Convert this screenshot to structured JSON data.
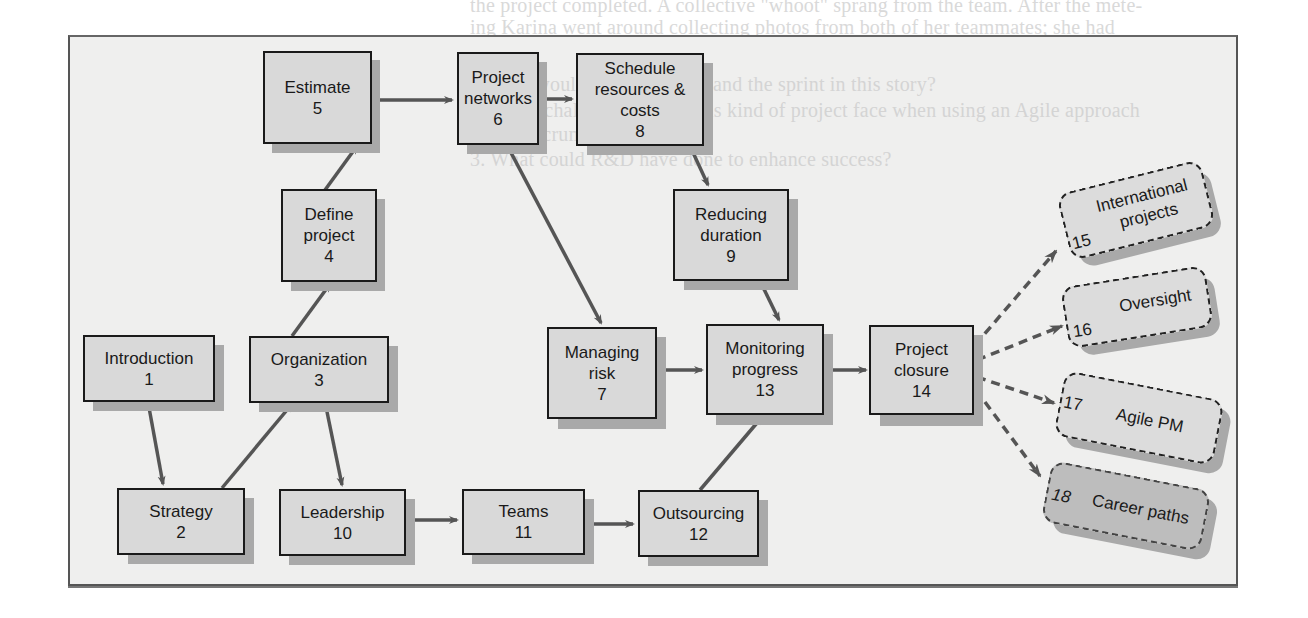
{
  "background_text": {
    "line1": "the project completed. A collective \"whoot\" sprang from the team. After the mete-",
    "line2": "ing Karina went around collecting photos from both of her teammates; she had",
    "line3": "predicted that the workload had taken about one month and finished.",
    "line4": "1. How would you assess XP and the sprint in this story?",
    "line5": "What challenges would this kind of project face when using an Agile approach",
    "line6": "like Scrum?",
    "line7": "3. What could R&D have done to enhance success?"
  },
  "diagram": {
    "nodes": [
      {
        "id": 1,
        "label": "Introduction",
        "number": "1"
      },
      {
        "id": 2,
        "label": "Strategy",
        "number": "2"
      },
      {
        "id": 3,
        "label": "Organization",
        "number": "3"
      },
      {
        "id": 4,
        "label_line1": "Define",
        "label_line2": "project",
        "number": "4"
      },
      {
        "id": 5,
        "label": "Estimate",
        "number": "5"
      },
      {
        "id": 6,
        "label_line1": "Project",
        "label_line2": "networks",
        "number": "6"
      },
      {
        "id": 7,
        "label_line1": "Managing",
        "label_line2": "risk",
        "number": "7"
      },
      {
        "id": 8,
        "label_line1": "Schedule",
        "label_line2": "resources & costs",
        "number": "8"
      },
      {
        "id": 9,
        "label_line1": "Reducing",
        "label_line2": "duration",
        "number": "9"
      },
      {
        "id": 10,
        "label": "Leadership",
        "number": "10"
      },
      {
        "id": 11,
        "label": "Teams",
        "number": "11"
      },
      {
        "id": 12,
        "label": "Outsourcing",
        "number": "12"
      },
      {
        "id": 13,
        "label_line1": "Monitoring",
        "label_line2": "progress",
        "number": "13"
      },
      {
        "id": 14,
        "label_line1": "Project",
        "label_line2": "closure",
        "number": "14"
      }
    ],
    "extensions": [
      {
        "id": 15,
        "label_line1": "International",
        "label_line2": "projects",
        "number": "15"
      },
      {
        "id": 16,
        "label": "Oversight",
        "number": "16"
      },
      {
        "id": 17,
        "label": "Agile PM",
        "number": "17"
      },
      {
        "id": 18,
        "label": "Career paths",
        "number": "18"
      }
    ],
    "edges": [
      {
        "from": 1,
        "to": 2
      },
      {
        "from": 2,
        "to": 3
      },
      {
        "from": 3,
        "to": 4
      },
      {
        "from": 3,
        "to": 10
      },
      {
        "from": 4,
        "to": 5
      },
      {
        "from": 5,
        "to": 6
      },
      {
        "from": 6,
        "to": 8
      },
      {
        "from": 6,
        "to": 7
      },
      {
        "from": 8,
        "to": 9
      },
      {
        "from": 9,
        "to": 13
      },
      {
        "from": 7,
        "to": 13
      },
      {
        "from": 10,
        "to": 11
      },
      {
        "from": 11,
        "to": 12
      },
      {
        "from": 12,
        "to": 13
      },
      {
        "from": 13,
        "to": 14
      },
      {
        "from": 14,
        "to": 15,
        "style": "dashed"
      },
      {
        "from": 14,
        "to": 16,
        "style": "dashed"
      },
      {
        "from": 14,
        "to": 17,
        "style": "dashed"
      },
      {
        "from": 14,
        "to": 18,
        "style": "dashed"
      }
    ],
    "colors": {
      "box_fill": "#d9d9d9",
      "box_border": "#1a1a1a",
      "shadow": "#a9a9a9",
      "arrow": "#555555",
      "frame_fill": "#efefee",
      "career_fill": "#bdbdbd"
    }
  }
}
